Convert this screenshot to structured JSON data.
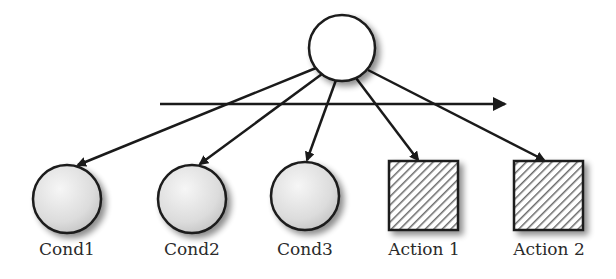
{
  "diagram": {
    "type": "tree",
    "root": {
      "id": "root",
      "label": "",
      "shape": "circle",
      "fill": "#ffffff"
    },
    "children": [
      {
        "id": "cond1",
        "label": "Cond1",
        "shape": "circle",
        "fill": "gradient-gray"
      },
      {
        "id": "cond2",
        "label": "Cond2",
        "shape": "circle",
        "fill": "gradient-gray"
      },
      {
        "id": "cond3",
        "label": "Cond3",
        "shape": "circle",
        "fill": "gradient-gray"
      },
      {
        "id": "action1",
        "label": "Action 1",
        "shape": "square",
        "fill": "hatched"
      },
      {
        "id": "action2",
        "label": "Action 2",
        "shape": "square",
        "fill": "hatched"
      }
    ],
    "edges": [
      {
        "from": "root",
        "to": "cond1"
      },
      {
        "from": "root",
        "to": "cond2"
      },
      {
        "from": "root",
        "to": "cond3"
      },
      {
        "from": "root",
        "to": "action1"
      },
      {
        "from": "root",
        "to": "action2"
      }
    ],
    "order_arrow": {
      "direction": "left-to-right",
      "label": ""
    },
    "colors": {
      "stroke": "#1a1a1a",
      "hatch": "#555555",
      "circle_fill_light": "#f4f4f4",
      "circle_fill_dark": "#c8c8c8"
    }
  }
}
